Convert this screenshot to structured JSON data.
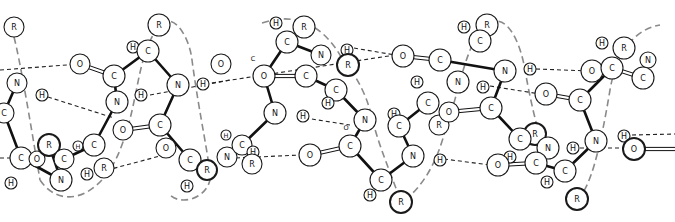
{
  "figure": {
    "colors": {
      "background": "#ffffff",
      "ink": "#111111",
      "helix_trace": "#8a8a8a"
    }
  },
  "labels": {
    "carbon": "C",
    "nitrogen": "N",
    "oxygen": "O",
    "hydrogen": "H",
    "side_chain": "R"
  },
  "atoms": [
    {
      "id": "a1",
      "el": "R",
      "x": 14,
      "y": 27,
      "r": 10
    },
    {
      "id": "a2",
      "el": "N",
      "x": 17,
      "y": 83,
      "r": 10
    },
    {
      "id": "a3",
      "el": "H",
      "x": 42,
      "y": 95,
      "r": 6
    },
    {
      "id": "a4",
      "el": "C",
      "x": 4,
      "y": 113,
      "r": 10
    },
    {
      "id": "a5",
      "el": "C",
      "x": 21,
      "y": 158,
      "r": 11
    },
    {
      "id": "a6",
      "el": "H",
      "x": 11,
      "y": 183,
      "r": 6
    },
    {
      "id": "a7",
      "el": "O",
      "x": 37,
      "y": 159,
      "r": 8
    },
    {
      "id": "a8",
      "el": "R",
      "x": 49,
      "y": 145,
      "r": 11,
      "bold": true
    },
    {
      "id": "a9",
      "el": "C",
      "x": 64,
      "y": 159,
      "r": 10
    },
    {
      "id": "a10",
      "el": "N",
      "x": 61,
      "y": 180,
      "r": 11
    },
    {
      "id": "a11",
      "el": "H",
      "x": 87,
      "y": 174,
      "r": 6
    },
    {
      "id": "a12",
      "el": "H",
      "x": 78,
      "y": 146,
      "r": 5,
      "small": true
    },
    {
      "id": "a13",
      "el": "C",
      "x": 94,
      "y": 145,
      "r": 11
    },
    {
      "id": "a14",
      "el": "R",
      "x": 104,
      "y": 168,
      "r": 10
    },
    {
      "id": "a15",
      "el": "O",
      "x": 80,
      "y": 64,
      "r": 10
    },
    {
      "id": "a16",
      "el": "C",
      "x": 114,
      "y": 76,
      "r": 11
    },
    {
      "id": "a17",
      "el": "N",
      "x": 117,
      "y": 102,
      "r": 11
    },
    {
      "id": "a18",
      "el": "H",
      "x": 141,
      "y": 95,
      "r": 6
    },
    {
      "id": "a19",
      "el": "O",
      "x": 123,
      "y": 130,
      "r": 10
    },
    {
      "id": "a20",
      "el": "C",
      "x": 160,
      "y": 125,
      "r": 11
    },
    {
      "id": "a21",
      "el": "O",
      "x": 166,
      "y": 148,
      "r": 10
    },
    {
      "id": "a22",
      "el": "C",
      "x": 190,
      "y": 160,
      "r": 11
    },
    {
      "id": "a23",
      "el": "R",
      "x": 207,
      "y": 170,
      "r": 10,
      "bold": true
    },
    {
      "id": "a24",
      "el": "H",
      "x": 187,
      "y": 186,
      "r": 6
    },
    {
      "id": "a25",
      "el": "R",
      "x": 159,
      "y": 25,
      "r": 11
    },
    {
      "id": "a26",
      "el": "H",
      "x": 133,
      "y": 47,
      "r": 6
    },
    {
      "id": "a27",
      "el": "C",
      "x": 148,
      "y": 51,
      "r": 11
    },
    {
      "id": "a28",
      "el": "N",
      "x": 178,
      "y": 85,
      "r": 11
    },
    {
      "id": "a29",
      "el": "H",
      "x": 203,
      "y": 84,
      "r": 6
    },
    {
      "id": "a30",
      "el": "O",
      "x": 221,
      "y": 64,
      "r": 10
    },
    {
      "id": "a31",
      "el": "N",
      "x": 227,
      "y": 157,
      "r": 10
    },
    {
      "id": "a32",
      "el": "H",
      "x": 226,
      "y": 135,
      "r": 5,
      "small": true
    },
    {
      "id": "a33",
      "el": "C",
      "x": 242,
      "y": 145,
      "r": 10
    },
    {
      "id": "a34",
      "el": "H",
      "x": 253,
      "y": 152,
      "r": 6
    },
    {
      "id": "a35",
      "el": "R",
      "x": 252,
      "y": 164,
      "r": 10
    },
    {
      "id": "a36",
      "el": "O",
      "x": 264,
      "y": 76,
      "r": 11
    },
    {
      "id": "a37",
      "el": "C",
      "x": 253,
      "y": 58,
      "r": 5,
      "small": true,
      "bare": true
    },
    {
      "id": "a38",
      "el": "H",
      "x": 276,
      "y": 23,
      "r": 6
    },
    {
      "id": "a39",
      "el": "C",
      "x": 287,
      "y": 42,
      "r": 11
    },
    {
      "id": "a40",
      "el": "R",
      "x": 304,
      "y": 27,
      "r": 11
    },
    {
      "id": "a41",
      "el": "N",
      "x": 321,
      "y": 55,
      "r": 10
    },
    {
      "id": "a42",
      "el": "C",
      "x": 306,
      "y": 76,
      "r": 11
    },
    {
      "id": "a43",
      "el": "N",
      "x": 275,
      "y": 113,
      "r": 11
    },
    {
      "id": "a44",
      "el": "H",
      "x": 303,
      "y": 116,
      "r": 6
    },
    {
      "id": "a45",
      "el": "O",
      "x": 310,
      "y": 155,
      "r": 11
    },
    {
      "id": "a46",
      "el": "C",
      "x": 336,
      "y": 90,
      "r": 11
    },
    {
      "id": "a47",
      "el": "H",
      "x": 328,
      "y": 103,
      "r": 6
    },
    {
      "id": "a48",
      "el": "H",
      "x": 347,
      "y": 50,
      "r": 6
    },
    {
      "id": "a49",
      "el": "R",
      "x": 348,
      "y": 65,
      "r": 11,
      "bold": true
    },
    {
      "id": "a50",
      "el": "N",
      "x": 365,
      "y": 120,
      "r": 11
    },
    {
      "id": "a51",
      "el": "O",
      "x": 346,
      "y": 127,
      "r": 5,
      "small": true,
      "bare": true
    },
    {
      "id": "a52",
      "el": "C",
      "x": 350,
      "y": 146,
      "r": 11
    },
    {
      "id": "a53",
      "el": "C",
      "x": 381,
      "y": 180,
      "r": 11
    },
    {
      "id": "a54",
      "el": "H",
      "x": 370,
      "y": 195,
      "r": 6
    },
    {
      "id": "a55",
      "el": "R",
      "x": 401,
      "y": 202,
      "r": 11,
      "bold": true
    },
    {
      "id": "a56",
      "el": "H",
      "x": 394,
      "y": 114,
      "r": 6
    },
    {
      "id": "a57",
      "el": "C",
      "x": 399,
      "y": 126,
      "r": 11
    },
    {
      "id": "a58",
      "el": "N",
      "x": 413,
      "y": 156,
      "r": 11
    },
    {
      "id": "a59",
      "el": "H",
      "x": 440,
      "y": 160,
      "r": 6
    },
    {
      "id": "a60",
      "el": "O",
      "x": 403,
      "y": 56,
      "r": 11
    },
    {
      "id": "a61",
      "el": "C",
      "x": 440,
      "y": 60,
      "r": 11
    },
    {
      "id": "a62",
      "el": "H",
      "x": 417,
      "y": 82,
      "r": 6
    },
    {
      "id": "a63",
      "el": "C",
      "x": 428,
      "y": 103,
      "r": 11
    },
    {
      "id": "a64",
      "el": "R",
      "x": 439,
      "y": 125,
      "r": 10
    },
    {
      "id": "a65",
      "el": "O",
      "x": 449,
      "y": 112,
      "r": 10
    },
    {
      "id": "a66",
      "el": "H",
      "x": 464,
      "y": 27,
      "r": 6
    },
    {
      "id": "a67",
      "el": "R",
      "x": 487,
      "y": 25,
      "r": 11
    },
    {
      "id": "a68",
      "el": "C",
      "x": 480,
      "y": 41,
      "r": 11
    },
    {
      "id": "a69",
      "el": "N",
      "x": 458,
      "y": 82,
      "r": 11
    },
    {
      "id": "a70",
      "el": "H",
      "x": 483,
      "y": 87,
      "r": 6
    },
    {
      "id": "a71",
      "el": "N",
      "x": 505,
      "y": 71,
      "r": 11
    },
    {
      "id": "a72",
      "el": "H",
      "x": 530,
      "y": 69,
      "r": 6
    },
    {
      "id": "a73",
      "el": "C",
      "x": 491,
      "y": 108,
      "r": 11
    },
    {
      "id": "a74",
      "el": "O",
      "x": 546,
      "y": 94,
      "r": 11
    },
    {
      "id": "a75",
      "el": "R",
      "x": 535,
      "y": 134,
      "r": 11,
      "bold": true
    },
    {
      "id": "a76",
      "el": "C",
      "x": 520,
      "y": 139,
      "r": 11
    },
    {
      "id": "a77",
      "el": "N",
      "x": 548,
      "y": 148,
      "r": 11
    },
    {
      "id": "a78",
      "el": "H",
      "x": 573,
      "y": 148,
      "r": 6
    },
    {
      "id": "a79",
      "el": "H",
      "x": 510,
      "y": 157,
      "r": 6
    },
    {
      "id": "a80",
      "el": "O",
      "x": 498,
      "y": 165,
      "r": 11
    },
    {
      "id": "a81",
      "el": "C",
      "x": 536,
      "y": 163,
      "r": 11
    },
    {
      "id": "a82",
      "el": "C",
      "x": 565,
      "y": 171,
      "r": 11
    },
    {
      "id": "a83",
      "el": "H",
      "x": 547,
      "y": 182,
      "r": 6
    },
    {
      "id": "a84",
      "el": "R",
      "x": 577,
      "y": 199,
      "r": 11,
      "bold": true
    },
    {
      "id": "a85",
      "el": "O",
      "x": 592,
      "y": 71,
      "r": 11
    },
    {
      "id": "a86",
      "el": "H",
      "x": 602,
      "y": 43,
      "r": 6
    },
    {
      "id": "a87",
      "el": "R",
      "x": 624,
      "y": 48,
      "r": 11
    },
    {
      "id": "a88",
      "el": "C",
      "x": 612,
      "y": 68,
      "r": 11
    },
    {
      "id": "a89",
      "el": "N",
      "x": 648,
      "y": 60,
      "r": 8
    },
    {
      "id": "a90",
      "el": "C",
      "x": 643,
      "y": 78,
      "r": 11
    },
    {
      "id": "a91",
      "el": "C",
      "x": 580,
      "y": 100,
      "r": 11
    },
    {
      "id": "a92",
      "el": "N",
      "x": 596,
      "y": 141,
      "r": 11
    },
    {
      "id": "a93",
      "el": "H",
      "x": 624,
      "y": 136,
      "r": 6
    },
    {
      "id": "a94",
      "el": "O",
      "x": 634,
      "y": 149,
      "r": 11,
      "bold": true
    }
  ],
  "bonds": [
    [
      "a2",
      "a4"
    ],
    [
      "a4",
      "a5"
    ],
    [
      "a5",
      "a10"
    ],
    [
      "a10",
      "a8"
    ],
    [
      "a9",
      "a10"
    ],
    [
      "a13",
      "a17"
    ],
    [
      "a17",
      "a16"
    ],
    [
      "a13",
      "a9"
    ],
    [
      "a27",
      "a28"
    ],
    [
      "a16",
      "a27"
    ],
    [
      "a28",
      "a20"
    ],
    [
      "a20",
      "a22"
    ],
    [
      "a22",
      "a23"
    ],
    [
      "a36",
      "a39"
    ],
    [
      "a36",
      "a43"
    ],
    [
      "a43",
      "a33"
    ],
    [
      "a39",
      "a41"
    ],
    [
      "a42",
      "a46"
    ],
    [
      "a46",
      "a50"
    ],
    [
      "a50",
      "a52"
    ],
    [
      "a52",
      "a53"
    ],
    [
      "a53",
      "a58"
    ],
    [
      "a58",
      "a57"
    ],
    [
      "a57",
      "a63"
    ],
    [
      "a61",
      "a71"
    ],
    [
      "a71",
      "a73"
    ],
    [
      "a73",
      "a76"
    ],
    [
      "a76",
      "a77"
    ],
    [
      "a77",
      "a81"
    ],
    [
      "a81",
      "a82"
    ],
    [
      "a88",
      "a91"
    ],
    [
      "a91",
      "a92"
    ],
    [
      "a92",
      "a82"
    ]
  ],
  "double_bonds": [
    [
      "a15",
      "a16"
    ],
    [
      "a19",
      "a20"
    ],
    [
      "a36",
      "a42"
    ],
    [
      "a45",
      "a52"
    ],
    [
      "a60",
      "a61"
    ],
    [
      "a65",
      "a73"
    ],
    [
      "a74",
      "a91"
    ],
    [
      "a80",
      "a81"
    ],
    [
      "a90",
      "a88"
    ],
    [
      "a94",
      "a94e"
    ]
  ],
  "hydrogen_bonds": [
    [
      0,
      70,
      80,
      64
    ],
    [
      48,
      97,
      114,
      118
    ],
    [
      150,
      95,
      230,
      80
    ],
    [
      100,
      172,
      175,
      152
    ],
    [
      205,
      84,
      395,
      55
    ],
    [
      236,
      158,
      300,
      155
    ],
    [
      305,
      118,
      350,
      125
    ],
    [
      354,
      48,
      395,
      55
    ],
    [
      444,
      159,
      490,
      165
    ],
    [
      490,
      86,
      540,
      94
    ],
    [
      536,
      69,
      590,
      71
    ],
    [
      580,
      148,
      626,
      148
    ],
    [
      632,
      135,
      675,
      134
    ],
    [
      0,
      158,
      12,
      158
    ]
  ],
  "helix_paths": [
    "M14,37 C20,60 30,120 40,180",
    "M40,180 C60,210 100,200 120,150 C140,100 135,60 159,25 C175,10 190,40 192,60 C200,120 210,160 210,180 C205,200 180,205 170,195",
    "M262,23 C300,10 325,30 340,55 C360,80 368,100 372,118 C380,150 390,170 400,200",
    "M405,200 C430,180 440,150 446,128 C460,90 466,40 487,25 C505,10 520,40 525,70 C532,110 540,140 548,160",
    "M577,199 C590,190 600,150 610,90 C615,60 630,30 660,25"
  ]
}
